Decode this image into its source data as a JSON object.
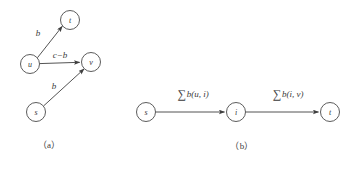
{
  "figure": {
    "background_color": "#ffffff",
    "stroke_color": "#3f3f3f",
    "text_color": "#3a3a3a",
    "panels": [
      {
        "id": "a",
        "caption": "（a）",
        "caption_x": 49,
        "caption_y": 145,
        "nodes": [
          {
            "id": "u",
            "label": "u",
            "cx": 30,
            "cy": 64,
            "r": 9.5
          },
          {
            "id": "t",
            "label": "t",
            "cx": 70,
            "cy": 20,
            "r": 9.5
          },
          {
            "id": "v",
            "label": "v",
            "cx": 91,
            "cy": 62,
            "r": 9.5
          },
          {
            "id": "s",
            "label": "s",
            "cx": 36,
            "cy": 112,
            "r": 9.5
          }
        ],
        "edges": [
          {
            "id": "u-t",
            "from": "u",
            "to": "t",
            "label": "b",
            "label_x": 38,
            "label_y": 33
          },
          {
            "id": "u-v",
            "from": "u",
            "to": "v",
            "label": "c−b",
            "label_x": 60,
            "label_y": 55
          },
          {
            "id": "s-v",
            "from": "s",
            "to": "v",
            "label": "b",
            "label_x": 54,
            "label_y": 86
          }
        ]
      },
      {
        "id": "b",
        "caption": "（b）",
        "caption_x": 242,
        "caption_y": 146,
        "nodes": [
          {
            "id": "s",
            "label": "s",
            "cx": 146,
            "cy": 112,
            "r": 9.5
          },
          {
            "id": "i",
            "label": "i",
            "cx": 236,
            "cy": 112,
            "r": 9.5
          },
          {
            "id": "t",
            "label": "t",
            "cx": 330,
            "cy": 112,
            "r": 9.5
          }
        ],
        "edges": [
          {
            "id": "s-i",
            "from": "s",
            "to": "i",
            "sum_symbol": "∑",
            "sum_term": "b(u, i)",
            "label": "∑b(u, i)",
            "label_x": 193,
            "label_y": 94
          },
          {
            "id": "i-t",
            "from": "i",
            "to": "t",
            "sum_symbol": "∑",
            "sum_term": "b(i, v)",
            "label": "∑b(i, v)",
            "label_x": 288,
            "label_y": 94
          }
        ]
      }
    ]
  }
}
